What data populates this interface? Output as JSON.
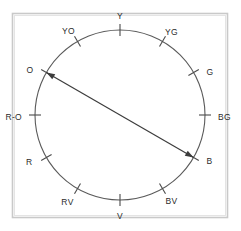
{
  "figure": {
    "background_color": "#ffffff",
    "frame_color": "#c9c9c9",
    "wheel_color": "#5a5a5a",
    "arrow_color": "#3c3c3c",
    "label_color": "#2b2b2b"
  },
  "chart_data": {
    "type": "scatter",
    "title": "",
    "xlabel": "",
    "ylabel": "",
    "grid": false,
    "legend": "none",
    "geometry": {
      "center_x": 120,
      "center_y": 115,
      "radius": 85,
      "tick_inner": 79,
      "tick_outer": 91
    },
    "categories": [
      "Y",
      "YG",
      "G",
      "BG",
      "B",
      "BV",
      "V",
      "RV",
      "R",
      "R-O",
      "O",
      "YO"
    ],
    "values": [
      90,
      60,
      30,
      0,
      330,
      300,
      270,
      240,
      210,
      180,
      150,
      120
    ],
    "points": [
      {
        "label": "Y",
        "name": "yellow",
        "angle_deg": 90,
        "label_dx": 0,
        "label_dy": -13,
        "anchor": "middle"
      },
      {
        "label": "YG",
        "name": "yellow-green",
        "angle_deg": 60,
        "label_dx": 9,
        "label_dy": -9,
        "anchor": "middle"
      },
      {
        "label": "G",
        "name": "green",
        "angle_deg": 30,
        "label_dx": 13,
        "label_dy": 0,
        "anchor": "start"
      },
      {
        "label": "BG",
        "name": "blue-green",
        "angle_deg": 0,
        "label_dx": 13,
        "label_dy": 3,
        "anchor": "start"
      },
      {
        "label": "B",
        "name": "blue",
        "angle_deg": -30,
        "label_dx": 13,
        "label_dy": 4,
        "anchor": "start"
      },
      {
        "label": "BV",
        "name": "blue-violet",
        "angle_deg": -60,
        "label_dx": 9,
        "label_dy": 13,
        "anchor": "middle"
      },
      {
        "label": "V",
        "name": "violet",
        "angle_deg": -90,
        "label_dx": 0,
        "label_dy": 17,
        "anchor": "middle"
      },
      {
        "label": "RV",
        "name": "red-violet",
        "angle_deg": -120,
        "label_dx": -10,
        "label_dy": 14,
        "anchor": "middle"
      },
      {
        "label": "R",
        "name": "red",
        "angle_deg": -150,
        "label_dx": -14,
        "label_dy": 5,
        "anchor": "end"
      },
      {
        "label": "R-O",
        "name": "red-orange",
        "angle_deg": 180,
        "label_dx": -13,
        "label_dy": 3,
        "anchor": "end"
      },
      {
        "label": "O",
        "name": "orange",
        "angle_deg": 150,
        "label_dx": -13,
        "label_dy": -2,
        "anchor": "end"
      },
      {
        "label": "YO",
        "name": "yellow-orange",
        "angle_deg": 120,
        "label_dx": -9,
        "label_dy": -10,
        "anchor": "middle"
      }
    ],
    "annotations": [
      {
        "kind": "double-headed-arrow",
        "from": "O",
        "to": "B",
        "from_angle_deg": 150,
        "to_angle_deg": -30,
        "description": "complementary pair connector"
      }
    ]
  }
}
